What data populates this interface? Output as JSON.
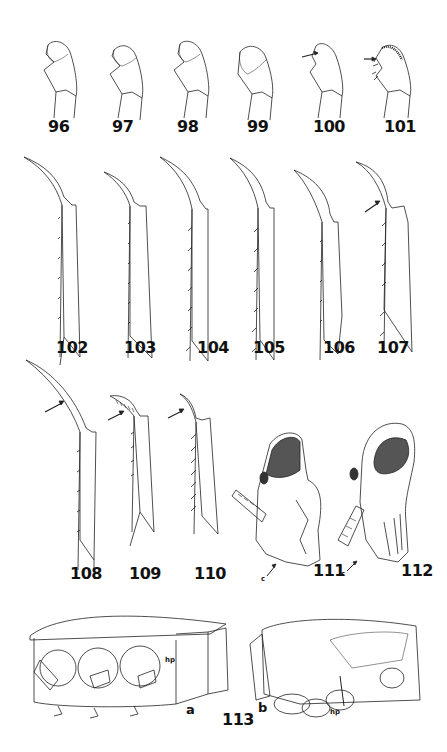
{
  "plate": {
    "figures_row1": [
      {
        "number": "96",
        "subject": "palp segment"
      },
      {
        "number": "97",
        "subject": "palp segment"
      },
      {
        "number": "98",
        "subject": "palp segment"
      },
      {
        "number": "99",
        "subject": "palp segment"
      },
      {
        "number": "100",
        "subject": "palp segment",
        "arrow": true
      },
      {
        "number": "101",
        "subject": "palp segment",
        "arrow": true
      }
    ],
    "figures_row2": [
      {
        "number": "102",
        "subject": "tibia and tarsal claw"
      },
      {
        "number": "103",
        "subject": "tibia and tarsal claw"
      },
      {
        "number": "104",
        "subject": "tibia and tarsal claw"
      },
      {
        "number": "105",
        "subject": "tibia and tarsal claw"
      },
      {
        "number": "106",
        "subject": "tibia and tarsal claw"
      },
      {
        "number": "107",
        "subject": "tibia and tarsal claw",
        "arrow": true
      }
    ],
    "figures_row3": [
      {
        "number": "108",
        "subject": "tibia and tarsal claw",
        "arrow": true
      },
      {
        "number": "109",
        "subject": "tibia and tarsal claw",
        "arrow": true
      },
      {
        "number": "110",
        "subject": "tibia and tarsal claw",
        "arrow": true
      },
      {
        "number": "111",
        "subject": "head lateral view",
        "annotation": "c"
      },
      {
        "number": "112",
        "subject": "head lateral view",
        "annotation": "c"
      }
    ],
    "figure_113": {
      "number": "113",
      "panels": [
        {
          "letter": "a",
          "annotation": "hp"
        },
        {
          "letter": "b",
          "annotation": "hp"
        }
      ]
    }
  }
}
